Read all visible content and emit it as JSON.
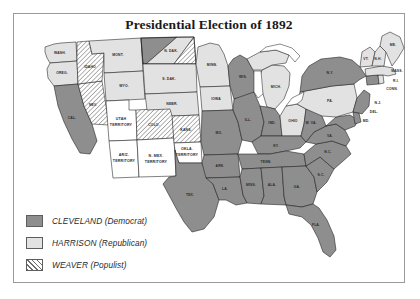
{
  "map": {
    "title": "Presidential Election of 1892",
    "colors": {
      "cleveland": "#8e8e8e",
      "harrison": "#e2e2e2",
      "weaver_hatch": "#6e6e6e",
      "territory": "#ffffff",
      "outline": "#1a1a1a",
      "frame": "#9a9a9a",
      "background": "#ffffff"
    },
    "legend": {
      "items": [
        {
          "swatch": "cleveland-swatch",
          "candidate": "CLEVELAND",
          "party": "(Democrat)",
          "label": "CLEVELAND (Democrat)"
        },
        {
          "swatch": "harrison-swatch",
          "candidate": "HARRISON",
          "party": "(Republican)",
          "label": "HARRISON (Republican)"
        },
        {
          "swatch": "weaver-swatch",
          "candidate": "WEAVER",
          "party": "(Populist)",
          "label": "WEAVER (Populist)"
        }
      ]
    },
    "states": [
      {
        "abbr": "WASH.",
        "name": "Washington",
        "result": "harrison"
      },
      {
        "abbr": "OREG.",
        "name": "Oregon",
        "result": "harrison"
      },
      {
        "abbr": "CAL.",
        "name": "California",
        "result": "cleveland"
      },
      {
        "abbr": "NEV.",
        "name": "Nevada",
        "result": "weaver"
      },
      {
        "abbr": "IDAHO",
        "name": "Idaho",
        "result": "weaver"
      },
      {
        "abbr": "MONT.",
        "name": "Montana",
        "result": "harrison"
      },
      {
        "abbr": "WYO.",
        "name": "Wyoming",
        "result": "harrison"
      },
      {
        "abbr": "COLO.",
        "name": "Colorado",
        "result": "weaver"
      },
      {
        "abbr": "N. DAK.",
        "name": "North Dakota",
        "result": "split"
      },
      {
        "abbr": "S. DAK.",
        "name": "South Dakota",
        "result": "harrison"
      },
      {
        "abbr": "NEBR.",
        "name": "Nebraska",
        "result": "harrison"
      },
      {
        "abbr": "KANS.",
        "name": "Kansas",
        "result": "weaver"
      },
      {
        "abbr": "MINN.",
        "name": "Minnesota",
        "result": "harrison"
      },
      {
        "abbr": "IOWA",
        "name": "Iowa",
        "result": "harrison"
      },
      {
        "abbr": "MO.",
        "name": "Missouri",
        "result": "cleveland"
      },
      {
        "abbr": "ARK.",
        "name": "Arkansas",
        "result": "cleveland"
      },
      {
        "abbr": "LA.",
        "name": "Louisiana",
        "result": "cleveland"
      },
      {
        "abbr": "TEX.",
        "name": "Texas",
        "result": "cleveland"
      },
      {
        "abbr": "WIS.",
        "name": "Wisconsin",
        "result": "cleveland"
      },
      {
        "abbr": "ILL.",
        "name": "Illinois",
        "result": "cleveland"
      },
      {
        "abbr": "MICH.",
        "name": "Michigan",
        "result": "harrison"
      },
      {
        "abbr": "IND.",
        "name": "Indiana",
        "result": "cleveland"
      },
      {
        "abbr": "OHIO",
        "name": "Ohio",
        "result": "harrison"
      },
      {
        "abbr": "KY.",
        "name": "Kentucky",
        "result": "cleveland"
      },
      {
        "abbr": "TENN.",
        "name": "Tennessee",
        "result": "cleveland"
      },
      {
        "abbr": "MISS.",
        "name": "Mississippi",
        "result": "cleveland"
      },
      {
        "abbr": "ALA.",
        "name": "Alabama",
        "result": "cleveland"
      },
      {
        "abbr": "GA.",
        "name": "Georgia",
        "result": "cleveland"
      },
      {
        "abbr": "FLA.",
        "name": "Florida",
        "result": "cleveland"
      },
      {
        "abbr": "S.C.",
        "name": "South Carolina",
        "result": "cleveland"
      },
      {
        "abbr": "N.C.",
        "name": "North Carolina",
        "result": "cleveland"
      },
      {
        "abbr": "VA.",
        "name": "Virginia",
        "result": "cleveland"
      },
      {
        "abbr": "W. VA.",
        "name": "West Virginia",
        "result": "cleveland"
      },
      {
        "abbr": "MD.",
        "name": "Maryland",
        "result": "cleveland"
      },
      {
        "abbr": "DEL.",
        "name": "Delaware",
        "result": "cleveland"
      },
      {
        "abbr": "PA.",
        "name": "Pennsylvania",
        "result": "harrison"
      },
      {
        "abbr": "N.Y.",
        "name": "New York",
        "result": "cleveland"
      },
      {
        "abbr": "N.J.",
        "name": "New Jersey",
        "result": "cleveland"
      },
      {
        "abbr": "CONN.",
        "name": "Connecticut",
        "result": "cleveland"
      },
      {
        "abbr": "R.I.",
        "name": "Rhode Island",
        "result": "harrison"
      },
      {
        "abbr": "MASS.",
        "name": "Massachusetts",
        "result": "harrison"
      },
      {
        "abbr": "VT.",
        "name": "Vermont",
        "result": "harrison"
      },
      {
        "abbr": "N.H.",
        "name": "New Hampshire",
        "result": "harrison"
      },
      {
        "abbr": "ME.",
        "name": "Maine",
        "result": "harrison"
      }
    ],
    "territories": [
      {
        "line1": "UTAH",
        "line2": "TERRITORY",
        "name": "Utah Territory"
      },
      {
        "line1": "ARIZ.",
        "line2": "TERRITORY",
        "name": "Arizona Territory"
      },
      {
        "line1": "N. MEX.",
        "line2": "TERRITORY",
        "name": "New Mexico Territory"
      },
      {
        "line1": "OKLA.",
        "line2": "TERRITORY",
        "name": "Oklahoma Territory"
      }
    ]
  }
}
